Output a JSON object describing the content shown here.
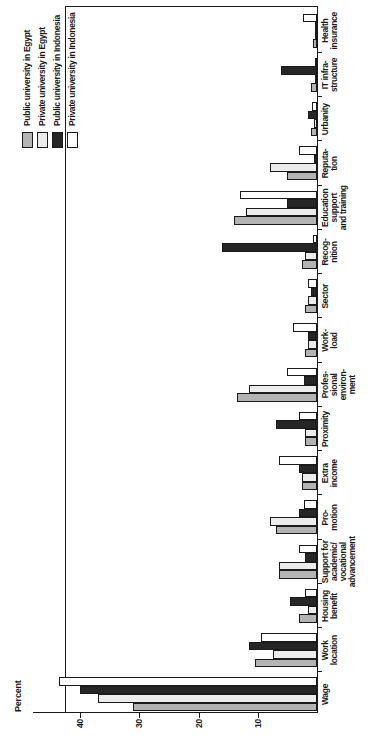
{
  "chart_data": {
    "type": "bar",
    "title": "",
    "ylabel": "Percent",
    "ylim": [
      0,
      45
    ],
    "yticks": [
      10,
      20,
      30,
      40
    ],
    "grid": false,
    "legend_position": "top-right",
    "layout_hint": "landscape grouped bar chart rotated 90 degrees counter-clockwise on the page; value axis at page bottom, category labels along page right edge",
    "categories": [
      "Wage",
      "Work location",
      "Housing benefit",
      "Support for academic/vocational advancement",
      "Promotion",
      "Extra income",
      "Proximity",
      "Professional environment",
      "Workload",
      "Sector",
      "Recognition",
      "Education support and training",
      "Reputation",
      "Urbanity",
      "IT infrastructure",
      "Health insurance"
    ],
    "category_display_lines": [
      [
        "Wage"
      ],
      [
        "Work",
        "location"
      ],
      [
        "Housing",
        "benefit"
      ],
      [
        "Support for",
        "academic/",
        "vocational",
        "advancement"
      ],
      [
        "Pro-",
        "motion"
      ],
      [
        "Extra",
        "income"
      ],
      [
        "Proximity"
      ],
      [
        "Profes-",
        "sional",
        "environ-",
        "ment"
      ],
      [
        "Work-",
        "load"
      ],
      [
        "Sector"
      ],
      [
        "Recog-",
        "nition"
      ],
      [
        "Education",
        "support",
        "and training"
      ],
      [
        "Reputa-",
        "tion"
      ],
      [
        "Urbanity"
      ],
      [
        "IT infra-",
        "structure"
      ],
      [
        "Health",
        "insurance"
      ]
    ],
    "series": [
      {
        "name": "Public university in Egypt",
        "color": "#b3b3b3",
        "values": [
          31,
          10.5,
          3,
          6.5,
          7,
          2.5,
          2,
          13.5,
          2,
          2,
          2.5,
          14,
          5,
          1,
          1,
          0.7
        ]
      },
      {
        "name": "Private university in Egypt",
        "color": "#ececec",
        "values": [
          37,
          7.5,
          1.5,
          6.5,
          8,
          2.5,
          2,
          11.5,
          1.5,
          1.5,
          2,
          12,
          8,
          0.5,
          0.3,
          0.2
        ]
      },
      {
        "name": "Public university in Indonesia",
        "color": "#262626",
        "values": [
          40,
          11.5,
          4.5,
          2,
          3,
          3,
          7,
          2.2,
          1.5,
          1,
          16,
          5,
          0.5,
          1.5,
          6,
          0.2
        ]
      },
      {
        "name": "Private university in Indonesia",
        "color": "#ffffff",
        "values": [
          43.5,
          9.5,
          2,
          3,
          2.2,
          6.5,
          3,
          5,
          4,
          1.5,
          0.7,
          13,
          3,
          0.8,
          0.3,
          2.3
        ]
      }
    ]
  }
}
